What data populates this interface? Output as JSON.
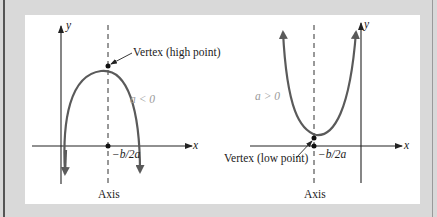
{
  "figure": {
    "colors": {
      "background_frame": "#d9d9d9",
      "panel": "#ffffff",
      "curve": "#5a5a5a",
      "axes": "#222222",
      "condition_label": "#9a9a9a"
    }
  },
  "left_graph": {
    "y_axis_label": "y",
    "x_axis_label": "x",
    "vertex_label": "Vertex (high point)",
    "condition_label": "a < 0",
    "x_intercept_label": "−b/2a",
    "axis_label": "Axis",
    "opens": "down"
  },
  "right_graph": {
    "y_axis_label": "y",
    "x_axis_label": "x",
    "vertex_label": "Vertex (low point)",
    "condition_label": "a > 0",
    "x_intercept_label": "−b/2a",
    "axis_label": "Axis",
    "opens": "up"
  }
}
